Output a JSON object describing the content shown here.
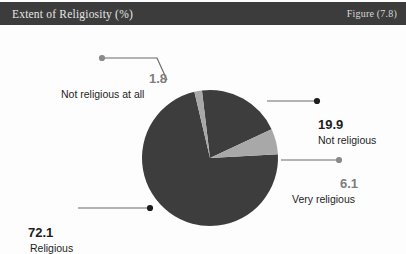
{
  "header": {
    "title": "Extent of Religiosity (%)",
    "figure_label": "Figure (7.8)"
  },
  "colors": {
    "header_background": "#3c3c3c",
    "header_text": "#e6e6e6",
    "page_background": "#fdfdfd",
    "slice_dark": "#3d3d3d",
    "slice_light": "#a8a8a8",
    "leader_line": "#6b6b6b",
    "label_text": "#1d1d1d",
    "muted_text": "#7d7d7d"
  },
  "chart_data": {
    "type": "pie",
    "title": "Extent of Religiosity (%)",
    "xlabel": "",
    "ylabel": "",
    "unit": "%",
    "total": 99.9,
    "legend": "none",
    "grid": false,
    "categories": [
      "Religious",
      "Not religious",
      "Very religious",
      "Not religious at all"
    ],
    "values": [
      72.1,
      19.9,
      6.1,
      1.8
    ],
    "slices": [
      {
        "label": "Religious",
        "value": 72.1,
        "value_text": "72.1",
        "color": "#3d3d3d"
      },
      {
        "label": "Not religious",
        "value": 19.9,
        "value_text": "19.9",
        "color": "#3d3d3d"
      },
      {
        "label": "Very religious",
        "value": 6.1,
        "value_text": "6.1",
        "color": "#a8a8a8"
      },
      {
        "label": "Not religious at all",
        "value": 1.8,
        "value_text": "1.8",
        "color": "#a8a8a8"
      }
    ]
  },
  "callouts": {
    "none_at_all": {
      "value": "1.8",
      "label": "Not religious at all"
    },
    "not": {
      "value": "19.9",
      "label": "Not religious"
    },
    "very": {
      "value": "6.1",
      "label": "Very religious"
    },
    "religious": {
      "value": "72.1",
      "label": "Religious"
    }
  }
}
